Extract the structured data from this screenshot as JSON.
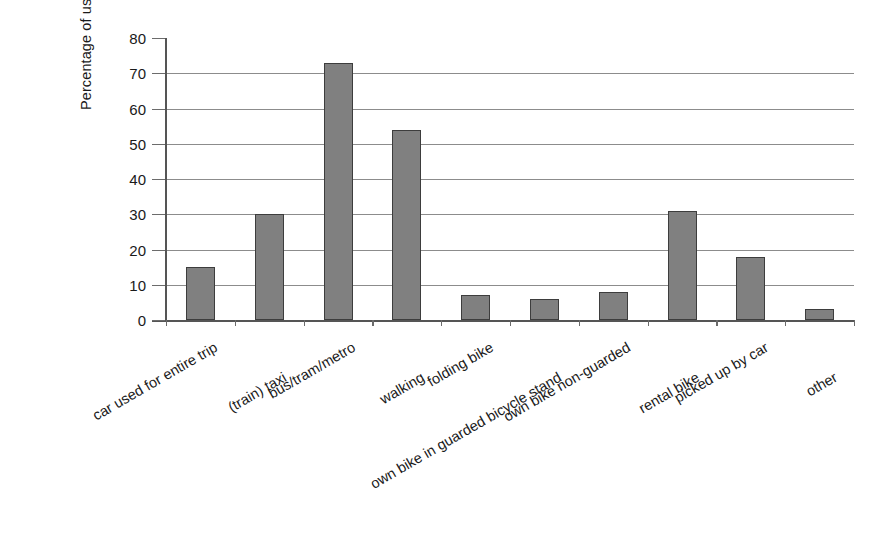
{
  "chart_data": {
    "type": "bar",
    "title": "",
    "xlabel": "",
    "ylabel": "Percentage of use",
    "ylim": [
      0,
      80
    ],
    "ytick_step": 10,
    "ytick_labels": [
      "80",
      "70",
      "60",
      "50",
      "40",
      "30",
      "20",
      "10",
      "0"
    ],
    "grid": true,
    "legend": "none",
    "bar_color": "#808080",
    "bar_border_color": "#3d3d3d",
    "gridline_color": "#8c8c8c",
    "axis_color": "#555555",
    "label_rotation_deg": -30,
    "categories": [
      "car used for entire trip",
      "(train) taxi",
      "bus/tram/metro",
      "walking",
      "folding bike",
      "own bike in guarded bicycle stand",
      "own bike non-guarded",
      "rental bike",
      "picked up by car",
      "other"
    ],
    "values": [
      15,
      30,
      73,
      54,
      7,
      6,
      8,
      31,
      18,
      3
    ]
  }
}
